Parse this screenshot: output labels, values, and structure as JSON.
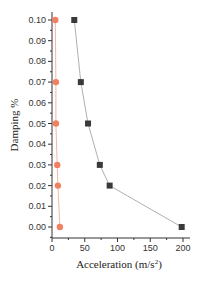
{
  "chart_data": {
    "type": "line",
    "title": "",
    "xlabel": "Acceleration (m/s2)",
    "xlabel_main": "Acceleration (m/s",
    "xlabel_sup": "2",
    "xlabel_end": ")",
    "ylabel": "Damping %",
    "xlim": [
      0,
      210
    ],
    "ylim": [
      -0.005,
      0.104
    ],
    "xticks": [
      0,
      50,
      100,
      150,
      200
    ],
    "yticks": [
      0.0,
      0.01,
      0.02,
      0.03,
      0.04,
      0.05,
      0.06,
      0.07,
      0.08,
      0.09,
      0.1
    ],
    "xtick_labels": [
      "0",
      "50",
      "100",
      "150",
      "200"
    ],
    "ytick_labels": [
      "0.00",
      "0.01",
      "0.02",
      "0.03",
      "0.04",
      "0.05",
      "0.06",
      "0.07",
      "0.08",
      "0.09",
      "0.10"
    ],
    "grid": false,
    "legend": null,
    "series": [
      {
        "name": "series-orange-circles",
        "marker": "circle",
        "color": "#f08060",
        "line_color": "#f0b8a8",
        "points": [
          {
            "damping": 0.1,
            "acceleration": 5
          },
          {
            "damping": 0.07,
            "acceleration": 6
          },
          {
            "damping": 0.05,
            "acceleration": 6
          },
          {
            "damping": 0.03,
            "acceleration": 8
          },
          {
            "damping": 0.02,
            "acceleration": 9
          },
          {
            "damping": 0.0,
            "acceleration": 12
          }
        ]
      },
      {
        "name": "series-black-squares",
        "marker": "square",
        "color": "#3a3a3a",
        "line_color": "#b0b0b0",
        "points": [
          {
            "damping": 0.1,
            "acceleration": 34
          },
          {
            "damping": 0.07,
            "acceleration": 44
          },
          {
            "damping": 0.05,
            "acceleration": 55
          },
          {
            "damping": 0.03,
            "acceleration": 73
          },
          {
            "damping": 0.02,
            "acceleration": 88
          },
          {
            "damping": 0.0,
            "acceleration": 198
          }
        ]
      }
    ]
  }
}
